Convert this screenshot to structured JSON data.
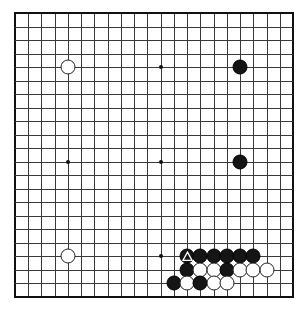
{
  "diagram": {
    "title": "Go board position",
    "board": {
      "columns": 22,
      "rows": 22,
      "origin_x": 15,
      "origin_y": 13,
      "cell_width": 13.24,
      "cell_height": 13.52,
      "line_color": "#3a3a3a",
      "edge_color": "#111111",
      "background_color": "#ffffff"
    },
    "hoshi": [
      {
        "col": 4,
        "row": 4
      },
      {
        "col": 11,
        "row": 4
      },
      {
        "col": 4,
        "row": 11
      },
      {
        "col": 11,
        "row": 11
      },
      {
        "col": 11,
        "row": 18
      }
    ],
    "stones": [
      {
        "col": 4,
        "row": 4,
        "color": "white",
        "mark": ""
      },
      {
        "col": 17,
        "row": 4,
        "color": "black",
        "mark": ""
      },
      {
        "col": 17,
        "row": 11,
        "color": "black",
        "mark": ""
      },
      {
        "col": 4,
        "row": 18,
        "color": "white",
        "mark": ""
      },
      {
        "col": 13,
        "row": 18,
        "color": "black",
        "mark": "triangle"
      },
      {
        "col": 14,
        "row": 18,
        "color": "black",
        "mark": ""
      },
      {
        "col": 15,
        "row": 18,
        "color": "black",
        "mark": ""
      },
      {
        "col": 16,
        "row": 18,
        "color": "black",
        "mark": ""
      },
      {
        "col": 17,
        "row": 18,
        "color": "black",
        "mark": ""
      },
      {
        "col": 18,
        "row": 18,
        "color": "black",
        "mark": ""
      },
      {
        "col": 13,
        "row": 19,
        "color": "black",
        "mark": ""
      },
      {
        "col": 14,
        "row": 19,
        "color": "white",
        "mark": ""
      },
      {
        "col": 15,
        "row": 19,
        "color": "white",
        "mark": ""
      },
      {
        "col": 16,
        "row": 19,
        "color": "black",
        "mark": ""
      },
      {
        "col": 17,
        "row": 19,
        "color": "white",
        "mark": ""
      },
      {
        "col": 18,
        "row": 19,
        "color": "white",
        "mark": ""
      },
      {
        "col": 19,
        "row": 19,
        "color": "white",
        "mark": ""
      },
      {
        "col": 12,
        "row": 20,
        "color": "black",
        "mark": ""
      },
      {
        "col": 13,
        "row": 20,
        "color": "white",
        "mark": ""
      },
      {
        "col": 14,
        "row": 20,
        "color": "black",
        "mark": ""
      },
      {
        "col": 15,
        "row": 20,
        "color": "white",
        "mark": ""
      },
      {
        "col": 16,
        "row": 20,
        "color": "white",
        "mark": ""
      }
    ],
    "marked_stone_note": "triangle"
  }
}
